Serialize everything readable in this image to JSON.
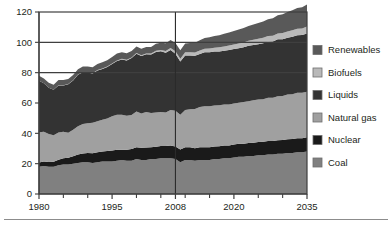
{
  "chart_data": {
    "type": "area",
    "stacked": true,
    "title": "",
    "subtitle": "",
    "xlabel": "",
    "ylabel": "",
    "xlim": [
      1980,
      2035
    ],
    "ylim": [
      0,
      120
    ],
    "yticks": [
      0,
      20,
      40,
      60,
      80,
      100,
      120
    ],
    "xticks": [
      1980,
      1995,
      2008,
      2020,
      2035
    ],
    "xtick_labels": [
      "1980",
      "1995",
      "2008",
      "2020",
      "2035"
    ],
    "ytick_labels": [
      "0",
      "20",
      "40",
      "60",
      "80",
      "100",
      "120"
    ],
    "minor_xticks": [
      1985,
      1990,
      2000,
      2005,
      2010,
      2015,
      2025,
      2030
    ],
    "gridlines": {
      "horizontal_at": [
        80,
        100
      ],
      "vertical_at": [
        2008
      ],
      "note": "vertical divider separates history from projection"
    },
    "legend_position": "right",
    "legend_order": [
      "Renewables",
      "Biofuels",
      "Liquids",
      "Natural gas",
      "Nuclear",
      "Coal"
    ],
    "stack_order_bottom_to_top": [
      "Coal",
      "Nuclear",
      "Natural gas",
      "Liquids",
      "Biofuels",
      "Renewables"
    ],
    "colors": {
      "Renewables": "#595959",
      "Biofuels": "#b9b9b9",
      "Liquids": "#333333",
      "Natural gas": "#a0a0a0",
      "Nuclear": "#1a1a1a",
      "Coal": "#808080"
    },
    "x": [
      1980,
      1981,
      1982,
      1983,
      1984,
      1985,
      1986,
      1987,
      1988,
      1989,
      1990,
      1991,
      1992,
      1993,
      1994,
      1995,
      1996,
      1997,
      1998,
      1999,
      2000,
      2001,
      2002,
      2003,
      2004,
      2005,
      2006,
      2007,
      2008,
      2009,
      2010,
      2011,
      2012,
      2013,
      2014,
      2015,
      2016,
      2017,
      2018,
      2019,
      2020,
      2021,
      2022,
      2023,
      2024,
      2025,
      2026,
      2027,
      2028,
      2029,
      2030,
      2031,
      2032,
      2033,
      2034,
      2035
    ],
    "series": [
      {
        "name": "Coal",
        "values": [
          18.0,
          18.5,
          18.0,
          18.0,
          19.0,
          19.5,
          19.5,
          20.0,
          20.5,
          21.0,
          21.0,
          20.5,
          21.0,
          21.5,
          21.5,
          21.5,
          22.0,
          22.5,
          22.0,
          22.0,
          23.0,
          22.5,
          22.5,
          23.0,
          23.0,
          23.5,
          23.5,
          23.5,
          23.0,
          21.0,
          22.5,
          22.5,
          22.0,
          22.5,
          22.5,
          22.5,
          23.0,
          23.0,
          23.5,
          23.5,
          24.0,
          24.5,
          24.5,
          25.0,
          25.0,
          25.5,
          25.5,
          26.0,
          26.0,
          26.5,
          26.5,
          27.0,
          27.0,
          27.5,
          27.5,
          28.0
        ]
      },
      {
        "name": "Nuclear",
        "values": [
          2.7,
          3.0,
          3.1,
          3.2,
          3.6,
          4.1,
          4.4,
          4.9,
          5.6,
          5.7,
          6.1,
          6.4,
          6.5,
          6.5,
          6.8,
          7.2,
          7.2,
          6.7,
          7.1,
          7.6,
          7.9,
          8.0,
          8.1,
          7.9,
          8.2,
          8.1,
          8.2,
          8.4,
          8.4,
          8.3,
          8.4,
          8.3,
          8.1,
          8.3,
          8.4,
          8.4,
          8.4,
          8.5,
          8.5,
          8.5,
          8.6,
          8.6,
          8.7,
          8.7,
          8.8,
          8.8,
          8.9,
          8.9,
          9.0,
          9.0,
          9.1,
          9.1,
          9.2,
          9.2,
          9.3,
          9.4
        ]
      },
      {
        "name": "Natural gas",
        "values": [
          20.0,
          19.5,
          18.5,
          17.5,
          18.0,
          17.5,
          16.5,
          17.5,
          18.5,
          19.5,
          19.5,
          20.0,
          20.5,
          21.0,
          21.5,
          22.5,
          23.0,
          23.0,
          22.5,
          22.5,
          23.5,
          22.5,
          23.5,
          22.5,
          22.5,
          22.5,
          22.0,
          23.5,
          23.5,
          23.0,
          24.5,
          25.0,
          26.0,
          26.5,
          27.0,
          27.0,
          27.0,
          27.0,
          27.0,
          27.0,
          27.0,
          27.0,
          27.5,
          27.5,
          28.0,
          28.0,
          28.0,
          28.5,
          28.5,
          29.0,
          29.0,
          29.5,
          29.5,
          30.0,
          30.0,
          30.0
        ]
      },
      {
        "name": "Liquids",
        "values": [
          34.0,
          32.0,
          30.5,
          30.0,
          31.0,
          30.5,
          32.0,
          32.5,
          34.0,
          34.0,
          33.5,
          32.5,
          33.5,
          33.5,
          34.0,
          34.5,
          35.5,
          36.5,
          36.5,
          37.5,
          38.0,
          38.0,
          38.0,
          38.5,
          40.0,
          40.0,
          39.5,
          39.5,
          37.5,
          35.0,
          36.0,
          35.5,
          35.0,
          35.0,
          35.5,
          35.5,
          35.5,
          35.5,
          35.5,
          36.0,
          36.0,
          36.0,
          36.0,
          36.5,
          36.5,
          36.5,
          37.0,
          37.0,
          37.0,
          37.5,
          37.5,
          37.5,
          38.0,
          38.0,
          38.0,
          38.5
        ]
      },
      {
        "name": "Biofuels",
        "values": [
          0.0,
          0.0,
          0.0,
          0.0,
          0.1,
          0.1,
          0.1,
          0.1,
          0.2,
          0.2,
          0.2,
          0.2,
          0.3,
          0.3,
          0.3,
          0.4,
          0.4,
          0.4,
          0.4,
          0.4,
          0.5,
          0.5,
          0.6,
          0.7,
          0.8,
          0.9,
          1.1,
          1.4,
          1.7,
          1.8,
          2.0,
          2.1,
          2.2,
          2.3,
          2.4,
          2.5,
          2.6,
          2.7,
          2.8,
          2.9,
          3.0,
          3.1,
          3.2,
          3.3,
          3.4,
          3.5,
          3.6,
          3.7,
          3.8,
          3.9,
          4.0,
          4.1,
          4.2,
          4.3,
          4.4,
          4.5
        ]
      },
      {
        "name": "Renewables",
        "values": [
          3.3,
          3.2,
          3.2,
          3.3,
          3.4,
          3.4,
          3.4,
          3.5,
          3.5,
          3.7,
          3.8,
          3.9,
          3.9,
          4.1,
          4.1,
          4.3,
          4.5,
          4.4,
          4.3,
          4.3,
          4.4,
          4.2,
          4.3,
          4.4,
          4.6,
          4.8,
          5.1,
          5.2,
          5.5,
          5.6,
          5.9,
          6.2,
          6.5,
          6.8,
          7.1,
          7.4,
          7.7,
          8.0,
          8.3,
          8.6,
          8.9,
          9.2,
          9.5,
          9.8,
          10.1,
          10.5,
          10.8,
          11.2,
          11.6,
          12.0,
          12.4,
          12.8,
          13.2,
          13.6,
          14.0,
          14.5
        ]
      }
    ]
  },
  "legend": {
    "items": [
      {
        "label": "Renewables",
        "color": "#595959"
      },
      {
        "label": "Biofuels",
        "color": "#b9b9b9"
      },
      {
        "label": "Liquids",
        "color": "#333333"
      },
      {
        "label": "Natural gas",
        "color": "#a0a0a0"
      },
      {
        "label": "Nuclear",
        "color": "#1a1a1a"
      },
      {
        "label": "Coal",
        "color": "#808080"
      }
    ]
  },
  "axes": {
    "y_labels": [
      "120",
      "100",
      "80",
      "60",
      "40",
      "20",
      "0"
    ],
    "x_labels": [
      "1980",
      "1995",
      "2008",
      "2020",
      "2035"
    ]
  }
}
